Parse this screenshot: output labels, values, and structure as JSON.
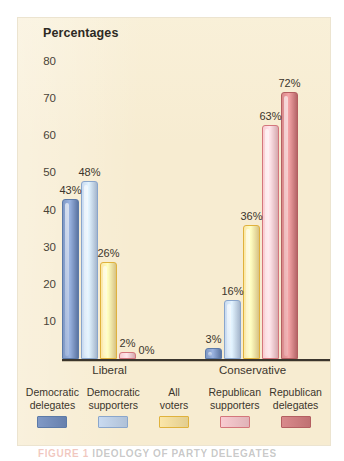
{
  "panel": {
    "background_color": "#f7ecd1",
    "title": "Percentages"
  },
  "caption": {
    "figure_label": "FIGURE 1",
    "figure_text": "IDEOLOGY OF PARTY DELEGATES"
  },
  "axis": {
    "y_ticks": [
      "80",
      "70",
      "60",
      "50",
      "40",
      "30",
      "20",
      "10"
    ],
    "x_groups": [
      "Liberal",
      "Conservative"
    ]
  },
  "legend": {
    "items": [
      {
        "line1": "Democratic",
        "line2": "delegates",
        "color": "#8099c6",
        "border": "#5c7aa8"
      },
      {
        "line1": "Democratic",
        "line2": "supporters",
        "color": "#c9daf0",
        "border": "#8aa6cc"
      },
      {
        "line1": "All",
        "line2": "voters",
        "color": "#fbe6a8",
        "border": "#e0b23c"
      },
      {
        "line1": "Republican",
        "line2": "supporters",
        "color": "#f9ccd1",
        "border": "#d4767c"
      },
      {
        "line1": "Republican",
        "line2": "delegates",
        "color": "#d98a8c",
        "border": "#b45f61"
      }
    ]
  },
  "chart_data": {
    "type": "bar",
    "title": "Percentages",
    "xlabel": "",
    "ylabel": "Percentages",
    "ylim": [
      0,
      80
    ],
    "ytick_step": 10,
    "grid": false,
    "legend_position": "bottom",
    "categories": [
      "Liberal",
      "Conservative"
    ],
    "series": [
      {
        "name": "Democratic delegates",
        "color": "#8099c6",
        "values": [
          43,
          3
        ],
        "labels": [
          "43%",
          "3%"
        ]
      },
      {
        "name": "Democratic supporters",
        "color": "#c9daf0",
        "values": [
          48,
          16
        ],
        "labels": [
          "48%",
          "16%"
        ]
      },
      {
        "name": "All voters",
        "color": "#fbe6a8",
        "values": [
          26,
          36
        ],
        "labels": [
          "26%",
          "36%"
        ]
      },
      {
        "name": "Republican supporters",
        "color": "#f9ccd1",
        "values": [
          2,
          63
        ],
        "labels": [
          "2%",
          "63%"
        ]
      },
      {
        "name": "Republican delegates",
        "color": "#d98a8c",
        "values": [
          0,
          72
        ],
        "labels": [
          "0%",
          "72%"
        ]
      }
    ]
  },
  "geometry": {
    "baseline_y": 359,
    "px_per_unit": 3.7125,
    "bar_width": 17,
    "group_x": [
      62,
      205
    ],
    "group_label_x": [
      62,
      205
    ],
    "bar_gap": 19
  }
}
